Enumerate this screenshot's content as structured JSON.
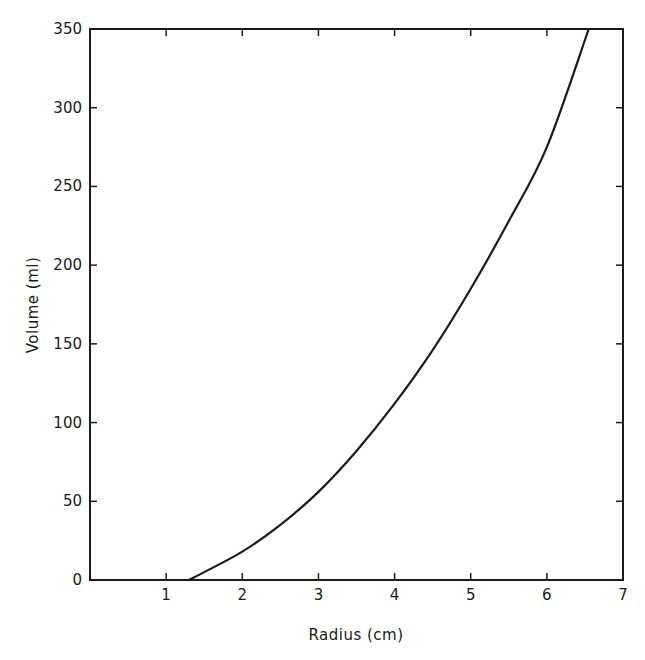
{
  "chart_data": {
    "type": "line",
    "title": "",
    "xlabel": "Radius (cm)",
    "ylabel": "Volume (ml)",
    "xlim": [
      0,
      7
    ],
    "ylim": [
      0,
      350
    ],
    "x_ticks": [
      1,
      2,
      3,
      4,
      5,
      6,
      7
    ],
    "y_ticks": [
      0,
      50,
      100,
      150,
      200,
      250,
      300,
      350
    ],
    "grid": false,
    "legend": null,
    "series": [
      {
        "name": "Volume vs Radius",
        "x": [
          1.3,
          1.5,
          2.0,
          2.5,
          3.0,
          3.5,
          4.0,
          4.5,
          5.0,
          5.5,
          6.0,
          6.55
        ],
        "y": [
          0,
          5,
          18,
          35,
          56,
          82,
          112,
          146,
          185,
          228,
          275,
          350
        ]
      }
    ],
    "line_color": "#1a1a1a"
  },
  "axes": {
    "x_tick_labels": [
      "1",
      "2",
      "3",
      "4",
      "5",
      "6",
      "7"
    ],
    "y_tick_labels": [
      "0",
      "50",
      "100",
      "150",
      "200",
      "250",
      "300",
      "350"
    ],
    "xlabel": "Radius (cm)",
    "ylabel": "Volume (ml)"
  }
}
